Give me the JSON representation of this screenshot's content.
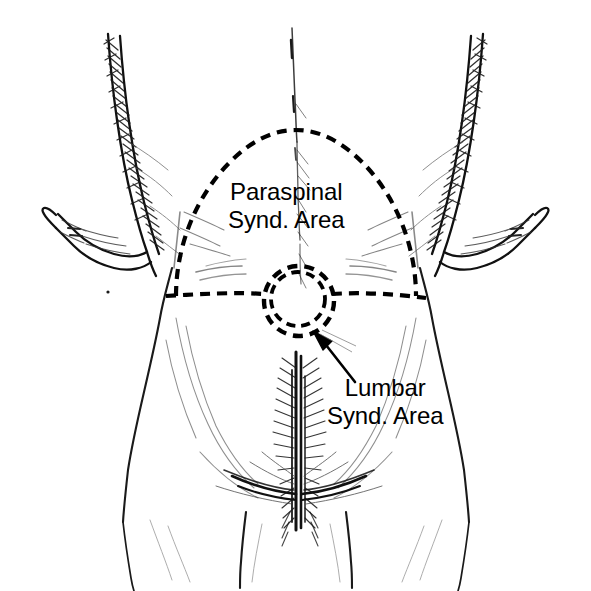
{
  "figure": {
    "view": "posterior (back) view of torso, hips and upper thighs with arms hanging at sides",
    "background_color": "#ffffff",
    "ink_color": "#000000"
  },
  "labels": {
    "paraspinal": {
      "line1": "Paraspinal",
      "line2": "Synd. Area",
      "full": "Paraspinal Synd. Area",
      "color": "#000000"
    },
    "lumbar": {
      "line1": "Lumbar",
      "line2": "Synd. Area",
      "full": "Lumbar Synd. Area",
      "color": "#000000"
    }
  },
  "annotations": {
    "leader_arrow": {
      "name": "arrow-to-lumbar-area",
      "from_label": "Lumbar Synd. Area",
      "points_to": "lumbar dashed circle",
      "direction": "up-left",
      "color": "#000000"
    }
  },
  "regions": {
    "paraspinal_zone": {
      "name": "paraspinal-syndrome-area",
      "shape": "dome / arch bounded below by horizontal line",
      "stroke": "dashed",
      "color": "#000000"
    },
    "lumbar_zone": {
      "name": "lumbar-syndrome-area",
      "shape": "two concentric circles",
      "stroke": "dashed",
      "color": "#000000"
    }
  }
}
